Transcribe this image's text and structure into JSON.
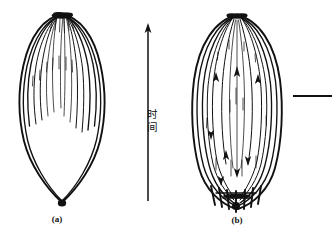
{
  "figure": {
    "background_color": "#ffffff",
    "ink_color": "#111111",
    "width": 332,
    "height": 237,
    "panels": [
      {
        "id": "a",
        "caption": "(a)",
        "caption_x": 57,
        "caption_y": 222,
        "shape": "pointed-oval-leaf",
        "description": "teardrop / leaf outline with internal curves radiating downward from top apex"
      },
      {
        "id": "b",
        "caption": "(b)",
        "caption_x": 237,
        "caption_y": 223,
        "shape": "full-ellipse-leaf",
        "description": "ellipse outline with internal curves spanning top to bottom with arrowheads both directions"
      }
    ],
    "time_axis": {
      "label_characters": [
        "时",
        "间"
      ],
      "label_full": "时间",
      "label_x": 152,
      "label_char1_y": 118,
      "label_char2_y": 131,
      "arrow_x": 148,
      "arrow_tip_y": 24,
      "arrow_tail_y": 201,
      "direction": "upward"
    },
    "scale_rule": {
      "x1": 293,
      "x2": 332,
      "y": 96
    }
  }
}
